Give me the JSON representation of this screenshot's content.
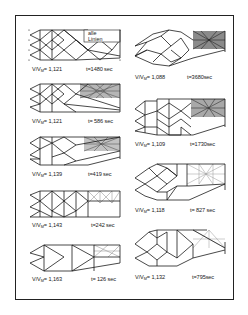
{
  "figure": {
    "annotation": {
      "line1": "alle",
      "line2": "Linien"
    },
    "panels": [
      {
        "id": "L1",
        "column": "left",
        "ratio_label": "V/V",
        "ratio_sub": "M",
        "ratio_value": "= 1,121",
        "time": "t=1480 sec"
      },
      {
        "id": "L2",
        "column": "left",
        "ratio_label": "V/V",
        "ratio_sub": "M",
        "ratio_value": "= 1,121",
        "time": "t= 586 sec"
      },
      {
        "id": "L3",
        "column": "left",
        "ratio_label": "V/V",
        "ratio_sub": "M",
        "ratio_value": "= 1,139",
        "time": "t=419 sec"
      },
      {
        "id": "L4",
        "column": "left",
        "ratio_label": "V/V",
        "ratio_sub": "M",
        "ratio_value": "= 1,143",
        "time": "t=242 sec"
      },
      {
        "id": "L5",
        "column": "left",
        "ratio_label": "V/V",
        "ratio_sub": "M",
        "ratio_value": "= 1,163",
        "time": "t= 126 sec"
      },
      {
        "id": "R1",
        "column": "right",
        "ratio_label": "V/V",
        "ratio_sub": "M",
        "ratio_value": "= 1,088",
        "time": "t=3680sec"
      },
      {
        "id": "R2",
        "column": "right",
        "ratio_label": "V/V",
        "ratio_sub": "M",
        "ratio_value": "= 1,109",
        "time": "t=1730sec"
      },
      {
        "id": "R3",
        "column": "right",
        "ratio_label": "V/V",
        "ratio_sub": "M",
        "ratio_value": "= 1,118",
        "time": "t= 827 sec"
      },
      {
        "id": "R4",
        "column": "right",
        "ratio_label": "V/V",
        "ratio_sub": "M",
        "ratio_value": "= 1,132",
        "time": "t=795sec"
      }
    ]
  },
  "colors": {
    "line": "#1a1a1a",
    "light_line": "#8a8a8a",
    "dense_fill": "#9a9a9a",
    "frame": "#222222",
    "background": "#ffffff"
  }
}
